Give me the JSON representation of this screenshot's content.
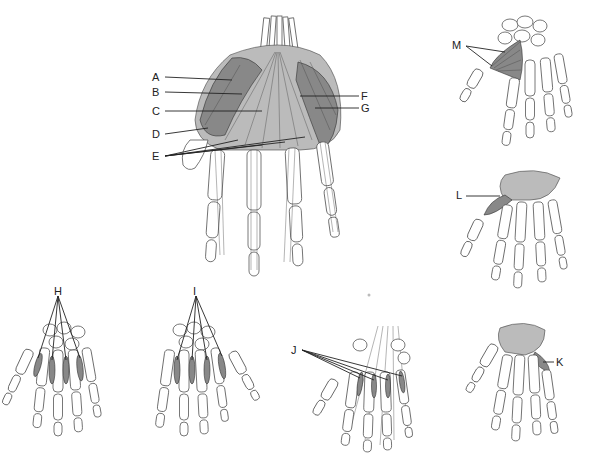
{
  "figure": {
    "labels": [
      {
        "id": "A",
        "text": "A",
        "x": 152,
        "y": 72
      },
      {
        "id": "B",
        "text": "B",
        "x": 152,
        "y": 87
      },
      {
        "id": "C",
        "text": "C",
        "x": 152,
        "y": 106
      },
      {
        "id": "D",
        "text": "D",
        "x": 152,
        "y": 129
      },
      {
        "id": "E",
        "text": "E",
        "x": 152,
        "y": 151
      },
      {
        "id": "F",
        "text": "F",
        "x": 361,
        "y": 91
      },
      {
        "id": "G",
        "text": "G",
        "x": 361,
        "y": 103
      },
      {
        "id": "H",
        "text": "H",
        "x": 54,
        "y": 286
      },
      {
        "id": "I",
        "text": "I",
        "x": 193,
        "y": 286
      },
      {
        "id": "J",
        "text": "J",
        "x": 291,
        "y": 345
      },
      {
        "id": "K",
        "text": "K",
        "x": 556,
        "y": 357
      },
      {
        "id": "L",
        "text": "L",
        "x": 456,
        "y": 190
      },
      {
        "id": "M",
        "text": "M",
        "x": 452,
        "y": 40
      }
    ],
    "panels": [
      {
        "name": "main-palmar-view",
        "labels": [
          "A",
          "B",
          "C",
          "D",
          "E",
          "F",
          "G"
        ]
      },
      {
        "name": "dorsal-interossei-view",
        "labels": [
          "H"
        ]
      },
      {
        "name": "palmar-interossei-view",
        "labels": [
          "I"
        ]
      },
      {
        "name": "lumbricals-view",
        "labels": [
          "J"
        ]
      },
      {
        "name": "opponens-digiti-minimi-view",
        "labels": [
          "K"
        ]
      },
      {
        "name": "opponens-pollicis-view",
        "labels": [
          "L"
        ]
      },
      {
        "name": "adductor-pollicis-view",
        "labels": [
          "M"
        ]
      }
    ]
  }
}
